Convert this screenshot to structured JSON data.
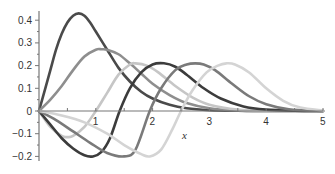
{
  "chart_data": {
    "type": "line",
    "title": "",
    "xlabel": "x",
    "ylabel": "",
    "xlim": [
      0,
      5
    ],
    "ylim": [
      -0.22,
      0.44
    ],
    "grid": false,
    "legend": null,
    "x_ticks": [
      1,
      2,
      3,
      4,
      5
    ],
    "x_tick_labels": [
      "1",
      "2",
      "3",
      "4",
      "5"
    ],
    "y_ticks": [
      0.4,
      0.3,
      0.2,
      0.1,
      0,
      -0.1,
      -0.2
    ],
    "y_tick_labels": [
      "0.4",
      "0.3",
      "0.2",
      "0.1",
      "0",
      "−0.1",
      "−0.2"
    ],
    "series": [
      {
        "name": "curve-1",
        "color": "#4a4a4a",
        "x": [
          0,
          0.1,
          0.2,
          0.3,
          0.4,
          0.5,
          0.6,
          0.7,
          0.8,
          0.9,
          1.0,
          1.2,
          1.4,
          1.6,
          1.8,
          2.0,
          2.3,
          2.6,
          3.0,
          3.5,
          4.0,
          5.0
        ],
        "y": [
          0,
          0.09,
          0.18,
          0.27,
          0.34,
          0.39,
          0.42,
          0.43,
          0.42,
          0.39,
          0.35,
          0.27,
          0.19,
          0.13,
          0.085,
          0.055,
          0.027,
          0.012,
          0.004,
          0.001,
          0,
          0
        ]
      },
      {
        "name": "curve-2",
        "color": "#8e8e8e",
        "x": [
          0,
          0.2,
          0.4,
          0.6,
          0.8,
          1.0,
          1.1,
          1.2,
          1.4,
          1.6,
          1.8,
          2.0,
          2.3,
          2.6,
          3.0,
          3.5,
          4.0,
          5.0
        ],
        "y": [
          0,
          0.05,
          0.11,
          0.18,
          0.24,
          0.27,
          0.272,
          0.27,
          0.25,
          0.21,
          0.165,
          0.12,
          0.07,
          0.035,
          0.012,
          0.002,
          0,
          0
        ]
      },
      {
        "name": "curve-3",
        "color": "#c6c6c6",
        "x": [
          0,
          0.2,
          0.4,
          0.5,
          0.6,
          0.8,
          1.0,
          1.2,
          1.4,
          1.6,
          1.7,
          1.9,
          2.1,
          2.4,
          2.7,
          3.0,
          3.5,
          4.0,
          5.0
        ],
        "y": [
          0,
          -0.07,
          -0.11,
          -0.115,
          -0.11,
          -0.07,
          0,
          0.08,
          0.16,
          0.205,
          0.21,
          0.2,
          0.17,
          0.11,
          0.06,
          0.028,
          0.006,
          0.001,
          0
        ]
      },
      {
        "name": "curve-4",
        "color": "#3c3c3c",
        "x": [
          0,
          0.2,
          0.4,
          0.6,
          0.8,
          0.95,
          1.1,
          1.25,
          1.42,
          1.6,
          1.8,
          2.0,
          2.2,
          2.4,
          2.6,
          2.9,
          3.2,
          3.6,
          4.0,
          4.5,
          5.0
        ],
        "y": [
          0,
          -0.06,
          -0.12,
          -0.165,
          -0.195,
          -0.2,
          -0.18,
          -0.12,
          0,
          0.1,
          0.17,
          0.205,
          0.21,
          0.195,
          0.16,
          0.1,
          0.055,
          0.02,
          0.006,
          0.001,
          0
        ]
      },
      {
        "name": "curve-5",
        "color": "#7a7a7a",
        "x": [
          0,
          0.3,
          0.6,
          0.9,
          1.2,
          1.5,
          1.7,
          1.95,
          2.15,
          2.4,
          2.6,
          2.75,
          2.9,
          3.1,
          3.4,
          3.7,
          4.0,
          4.4,
          5.0
        ],
        "y": [
          0,
          -0.04,
          -0.09,
          -0.14,
          -0.185,
          -0.2,
          -0.17,
          0,
          0.1,
          0.18,
          0.205,
          0.21,
          0.205,
          0.18,
          0.12,
          0.065,
          0.03,
          0.008,
          0
        ]
      },
      {
        "name": "curve-6",
        "color": "#d4d4d4",
        "x": [
          0,
          0.4,
          0.8,
          1.2,
          1.5,
          1.8,
          1.95,
          2.15,
          2.35,
          2.5,
          2.7,
          2.95,
          3.15,
          3.3,
          3.45,
          3.7,
          4.0,
          4.3,
          4.6,
          5.0
        ],
        "y": [
          0,
          -0.02,
          -0.05,
          -0.1,
          -0.15,
          -0.19,
          -0.2,
          -0.17,
          -0.08,
          0,
          0.09,
          0.17,
          0.2,
          0.21,
          0.205,
          0.17,
          0.1,
          0.045,
          0.015,
          0.002
        ]
      }
    ]
  }
}
